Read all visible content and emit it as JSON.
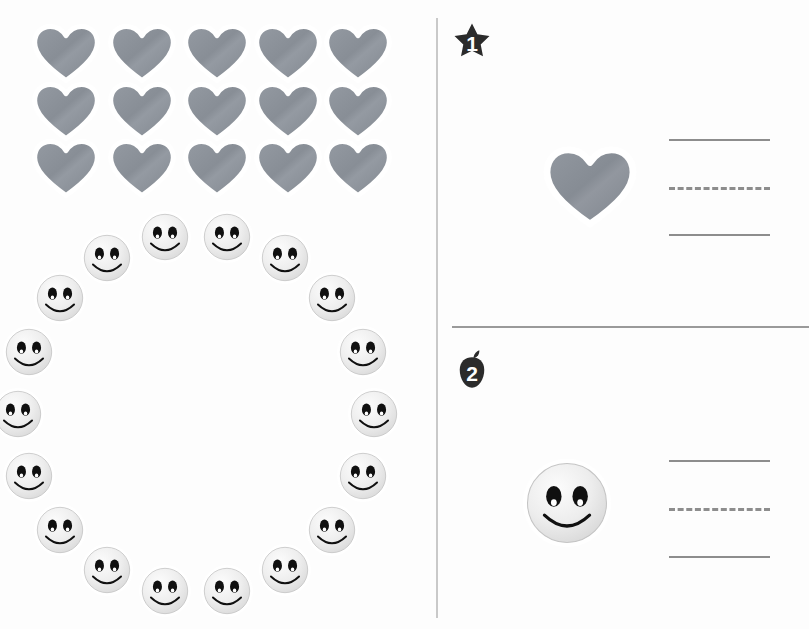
{
  "worksheet": {
    "background_color": "#fdfdfd",
    "divider_color": "#c9c9c9",
    "rule_color": "#9a9a9a"
  },
  "left_panel": {
    "heart_group": {
      "icon_name": "heart-sticker",
      "color": "#8a8f96",
      "outline_color": "#ffffff",
      "count": 15,
      "rows": 3,
      "columns": 5,
      "positions": [
        {
          "x": 30,
          "y": 20
        },
        {
          "x": 106,
          "y": 20
        },
        {
          "x": 181,
          "y": 20
        },
        {
          "x": 252,
          "y": 20
        },
        {
          "x": 322,
          "y": 20
        },
        {
          "x": 30,
          "y": 78
        },
        {
          "x": 106,
          "y": 78
        },
        {
          "x": 181,
          "y": 78
        },
        {
          "x": 252,
          "y": 78
        },
        {
          "x": 322,
          "y": 78
        },
        {
          "x": 30,
          "y": 135
        },
        {
          "x": 106,
          "y": 135
        },
        {
          "x": 181,
          "y": 135
        },
        {
          "x": 252,
          "y": 135
        },
        {
          "x": 322,
          "y": 135
        }
      ]
    },
    "smiley_group": {
      "icon_name": "smiley-face-sticker",
      "color": "#e8e8e8",
      "outline_color": "#ffffff",
      "feature_color": "#101010",
      "count": 18,
      "arrangement": "ring",
      "positions": [
        {
          "x": 147,
          "y": 208
        },
        {
          "x": 213,
          "y": 206
        },
        {
          "x": 275,
          "y": 227
        },
        {
          "x": 88,
          "y": 246
        },
        {
          "x": 325,
          "y": 268
        },
        {
          "x": 43,
          "y": 281
        },
        {
          "x": 355,
          "y": 333
        },
        {
          "x": 14,
          "y": 341
        },
        {
          "x": 360,
          "y": 398
        },
        {
          "x": 11,
          "y": 406
        },
        {
          "x": 355,
          "y": 458
        },
        {
          "x": 32,
          "y": 467
        },
        {
          "x": 318,
          "y": 518
        },
        {
          "x": 73,
          "y": 522
        },
        {
          "x": 265,
          "y": 548
        },
        {
          "x": 133,
          "y": 556
        },
        {
          "x": 196,
          "y": 556
        },
        {
          "x": 0,
          "y": 0
        }
      ]
    }
  },
  "right_panel": {
    "questions": [
      {
        "number": "1",
        "badge_shape": "star-badge",
        "badge_color": "#2b2b2b",
        "subject_icon": "heart-sticker",
        "lines": [
          "solid",
          "dashed",
          "solid"
        ]
      },
      {
        "number": "2",
        "badge_shape": "apple-badge",
        "badge_color": "#2b2b2b",
        "subject_icon": "smiley-face-sticker",
        "lines": [
          "solid",
          "dashed",
          "solid"
        ]
      }
    ]
  },
  "chart_data": {
    "type": "table",
    "categories": [
      "Hearts",
      "Smiley faces"
    ],
    "values": [
      15,
      18
    ],
    "xlabel": "Sticker type",
    "ylabel": "Count"
  }
}
